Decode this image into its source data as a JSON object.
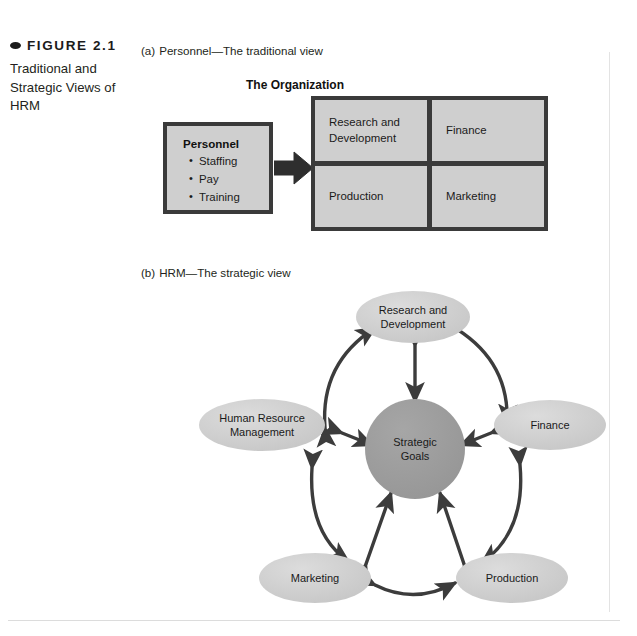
{
  "figure": {
    "bullet_icon": "oval-bullet-icon",
    "label": "FIGURE 2.1",
    "title": "Traditional and Strategic Views of HRM"
  },
  "panel_a": {
    "letter": "(a)",
    "label": "Personnel—The traditional view",
    "organization_title": "The Organization",
    "personnel_box": {
      "heading": "Personnel",
      "items": [
        "Staffing",
        "Pay",
        "Training"
      ]
    },
    "arrow_icon": "right-arrow-icon",
    "org_cells": [
      "Research and Development",
      "Finance",
      "Production",
      "Marketing"
    ]
  },
  "panel_b": {
    "letter": "(b)",
    "label": "HRM—The strategic view",
    "core": {
      "line1": "Strategic",
      "line2": "Goals"
    },
    "nodes": [
      {
        "id": "rnd",
        "line1": "Research and",
        "line2": "Development"
      },
      {
        "id": "finance",
        "line1": "Finance",
        "line2": ""
      },
      {
        "id": "production",
        "line1": "Production",
        "line2": ""
      },
      {
        "id": "marketing",
        "line1": "Marketing",
        "line2": ""
      },
      {
        "id": "hrm",
        "line1": "Human Resource",
        "line2": "Management"
      }
    ]
  },
  "colors": {
    "node_fill": "#cccccc",
    "core_fill": "#9a9a9a",
    "box_fill": "#cfcfcf",
    "frame": "#3a3a3a",
    "arrow": "#3c3c3c",
    "text": "#1a1a1a"
  }
}
